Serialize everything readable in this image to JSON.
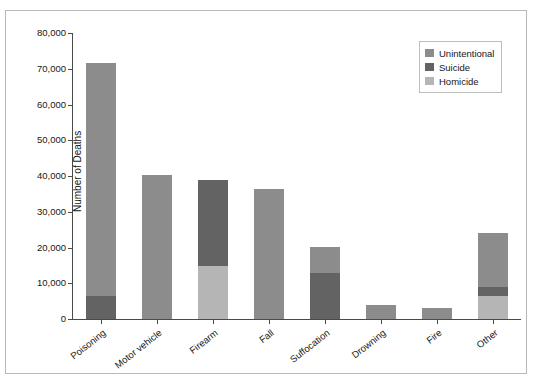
{
  "chart_data": {
    "type": "bar",
    "subtype": "stacked-vertical",
    "title": "",
    "xlabel": "",
    "ylabel": "Number of Deaths",
    "ylim": [
      0,
      80000
    ],
    "ytick_values": [
      0,
      10000,
      20000,
      30000,
      40000,
      50000,
      60000,
      70000,
      80000
    ],
    "ytick_labels": [
      "0",
      "10,000",
      "20,000",
      "30,000",
      "40,000",
      "50,000",
      "60,000",
      "70,000",
      "80,000"
    ],
    "grid": false,
    "legend_position": "top-right",
    "categories": [
      "Poisoning",
      "Motor vehicle",
      "Firearm",
      "Fall",
      "Suffocation",
      "Drowning",
      "Fire",
      "Other"
    ],
    "series": [
      {
        "name": "Unintentional",
        "color": "#8c8c8c",
        "values": [
          65000,
          40300,
          0,
          36500,
          7200,
          3900,
          3000,
          15000
        ]
      },
      {
        "name": "Suicide",
        "color": "#636363",
        "values": [
          6500,
          0,
          24200,
          0,
          13000,
          0,
          0,
          2500
        ]
      },
      {
        "name": "Homicide",
        "color": "#b5b5b5",
        "values": [
          0,
          0,
          14700,
          0,
          0,
          0,
          0,
          6500
        ]
      }
    ],
    "totals": [
      71500,
      40300,
      38900,
      36500,
      20200,
      3900,
      3000,
      24000
    ],
    "stack_order_bottom_to_top": {
      "Poisoning": [
        "Suicide",
        "Unintentional"
      ],
      "Motor vehicle": [
        "Unintentional"
      ],
      "Firearm": [
        "Homicide",
        "Suicide"
      ],
      "Fall": [
        "Unintentional"
      ],
      "Suffocation": [
        "Suicide",
        "Unintentional"
      ],
      "Drowning": [
        "Unintentional"
      ],
      "Fire": [
        "Unintentional"
      ],
      "Other": [
        "Homicide",
        "Suicide",
        "Unintentional"
      ]
    }
  },
  "legend": {
    "items": [
      {
        "label": "Unintentional",
        "color": "#8c8c8c"
      },
      {
        "label": "Suicide",
        "color": "#636363"
      },
      {
        "label": "Homicide",
        "color": "#b5b5b5"
      }
    ]
  },
  "axes": {
    "y_title": "Number of Deaths"
  }
}
